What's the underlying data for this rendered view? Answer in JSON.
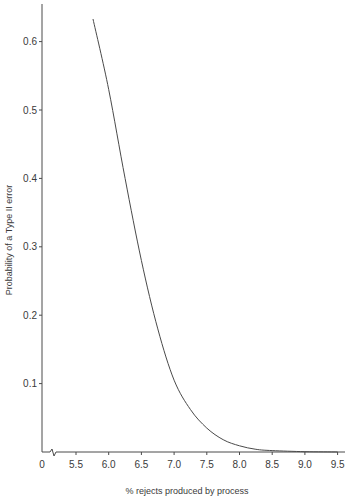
{
  "chart_data": {
    "type": "line",
    "title": "",
    "xlabel": "% rejects produced by process",
    "ylabel": "Probability of a Type II error",
    "x_axis_break": true,
    "x_ticks": [
      "0",
      "5.5",
      "6.0",
      "6.5",
      "7.0",
      "7.5",
      "8.0",
      "8.5",
      "9.0",
      "9.5"
    ],
    "y_ticks": [
      "0.1",
      "0.2",
      "0.3",
      "0.4",
      "0.5",
      "0.6"
    ],
    "xlim": [
      5.5,
      9.6
    ],
    "ylim": [
      0,
      0.65
    ],
    "grid": false,
    "legend": null,
    "series": [
      {
        "name": "Type II error probability",
        "color": "#4a4a4a",
        "x": [
          5.76,
          6.0,
          6.25,
          6.5,
          6.75,
          7.0,
          7.25,
          7.5,
          7.75,
          8.0,
          8.25,
          8.5,
          9.0,
          9.5
        ],
        "values": [
          0.633,
          0.53,
          0.4,
          0.28,
          0.18,
          0.105,
          0.062,
          0.035,
          0.018,
          0.009,
          0.004,
          0.002,
          0.0005,
          0.0
        ]
      }
    ]
  }
}
